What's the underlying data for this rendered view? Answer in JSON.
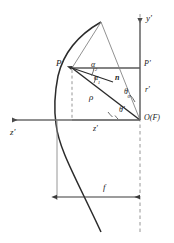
{
  "figure": {
    "type": "geometric-optics-diagram",
    "stroke_color": "#333333",
    "axis_color": "#555555",
    "background": "#ffffff"
  },
  "labels": {
    "point_p": "P",
    "point_p_prime": "P'",
    "origin_focus": "O(F)",
    "axis_y": "y'",
    "axis_z_arrow": "z'",
    "dim_z": "z'",
    "dim_r": "r'",
    "focal_length": "f",
    "radius_rho": "ρ",
    "normal_vector": "n",
    "angle_alpha1_base": "α",
    "angle_alpha1_sub": "1",
    "angle_alpha2_base": "α",
    "angle_alpha2_sub": "2",
    "angle_theta0_base": "θ",
    "angle_theta0_sub": "0",
    "angle_theta_prime": "θ'"
  },
  "geometry": {
    "point_p": {
      "x": 72,
      "y": 68
    },
    "point_o": {
      "x": 140,
      "y": 120
    },
    "point_p_prime": {
      "x": 140,
      "y": 68
    },
    "vertex_x": 57,
    "axis_y_top": 14,
    "axis_y_bottom": 232,
    "dim_line_y": 197,
    "curve_top": {
      "x": 100,
      "y": 22
    },
    "curve_bottom": {
      "x": 100,
      "y": 232
    }
  }
}
